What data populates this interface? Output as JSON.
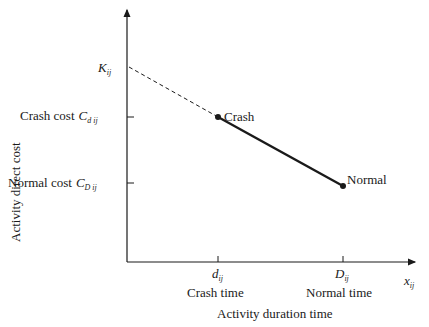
{
  "diagram": {
    "y_axis_label": "Activity direct cost",
    "x_axis_label": "Activity duration time",
    "x_axis_symbol": "x",
    "x_axis_symbol_sub": "ij",
    "y_ticks": [
      {
        "text": "K",
        "sub": "ij",
        "prefix": ""
      },
      {
        "prefix": "Crash cost",
        "text": "C",
        "sub": "d ij"
      },
      {
        "prefix": "Normal cost",
        "text": "C",
        "sub": "D ij"
      }
    ],
    "x_ticks": [
      {
        "symbol": "d",
        "sub": "ij",
        "label": "Crash time"
      },
      {
        "symbol": "D",
        "sub": "ij",
        "label": "Normal time"
      }
    ],
    "points": [
      {
        "label": "Crash"
      },
      {
        "label": "Normal"
      }
    ],
    "colors": {
      "line": "#1a1a1a",
      "background": "#ffffff"
    }
  }
}
